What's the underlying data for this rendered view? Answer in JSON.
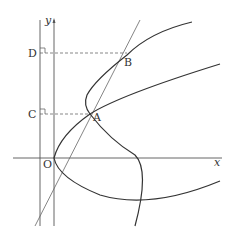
{
  "diagram": {
    "type": "coordinate-geometry",
    "axes": {
      "x_label": "x",
      "y_label": "y",
      "origin_label": "O"
    },
    "points": {
      "A": "A",
      "B": "B",
      "C": "C",
      "D": "D"
    },
    "elements": [
      "parabola with vertex at O opening right",
      "parabola with vertex right of y-axis opening right, through A and B",
      "line through O, A and B",
      "vertical line through C and D left of y-axis",
      "dashed horizontal from D to B",
      "dashed horizontal from C to A",
      "right-angle marks at C and D"
    ],
    "colors": {
      "curve": "#333333",
      "axis": "#555555",
      "background": "#ffffff"
    }
  }
}
